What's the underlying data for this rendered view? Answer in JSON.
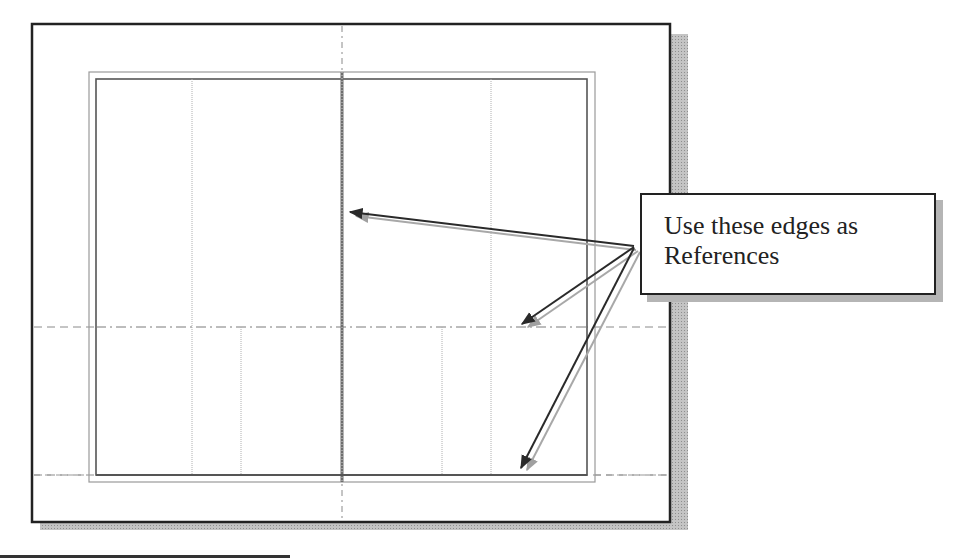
{
  "callout": {
    "line1": "Use these edges as",
    "line2": "References"
  },
  "colors": {
    "frame_border": "#222222",
    "shadow": "#b0b0b0",
    "sketch_line": "#555555",
    "construction_line": "#9a9a9a",
    "centerline": "#888888",
    "arrow_dark": "#2a2a2a",
    "arrow_light": "#9c9c9c"
  },
  "arrows": [
    {
      "name": "arrow-to-vertical-edge",
      "from": [
        634,
        247
      ],
      "to": [
        350,
        212
      ]
    },
    {
      "name": "arrow-to-horizontal-centerline",
      "from": [
        634,
        247
      ],
      "to": [
        522,
        326
      ]
    },
    {
      "name": "arrow-to-bottom-edge",
      "from": [
        634,
        247
      ],
      "to": [
        522,
        470
      ]
    }
  ]
}
